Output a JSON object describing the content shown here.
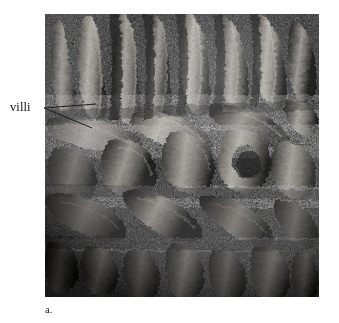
{
  "figure": {
    "caption_label": "a.",
    "plate": {
      "left": 45,
      "top": 14,
      "width": 274,
      "height": 283,
      "background_color": "#0a0a0a",
      "tone_light": "#b9b4ad",
      "tone_mid": "#6e6a64",
      "tone_dark": "#2a2826",
      "tone_shadow": "#070707"
    }
  },
  "annotations": [
    {
      "id": "villi",
      "label": "villi",
      "text_color": "#111111",
      "leader_color": "#111111",
      "leader_lines": [
        {
          "x1": 44,
          "y1": 108,
          "x2": 96,
          "y2": 104
        },
        {
          "x1": 44,
          "y1": 108,
          "x2": 92,
          "y2": 128
        }
      ]
    }
  ],
  "page": {
    "background_color": "#ffffff",
    "width": 339,
    "height": 323
  }
}
